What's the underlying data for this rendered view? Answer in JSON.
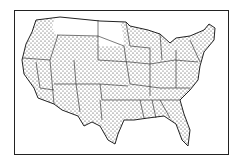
{
  "map": {
    "subject": "Contiguous United States state outlines",
    "style": "stippled dot pattern",
    "unshaded_states": [
      "Montana",
      "North Dakota",
      "South Dakota"
    ],
    "colors": {
      "ink": "#222222",
      "background": "#ffffff"
    }
  }
}
